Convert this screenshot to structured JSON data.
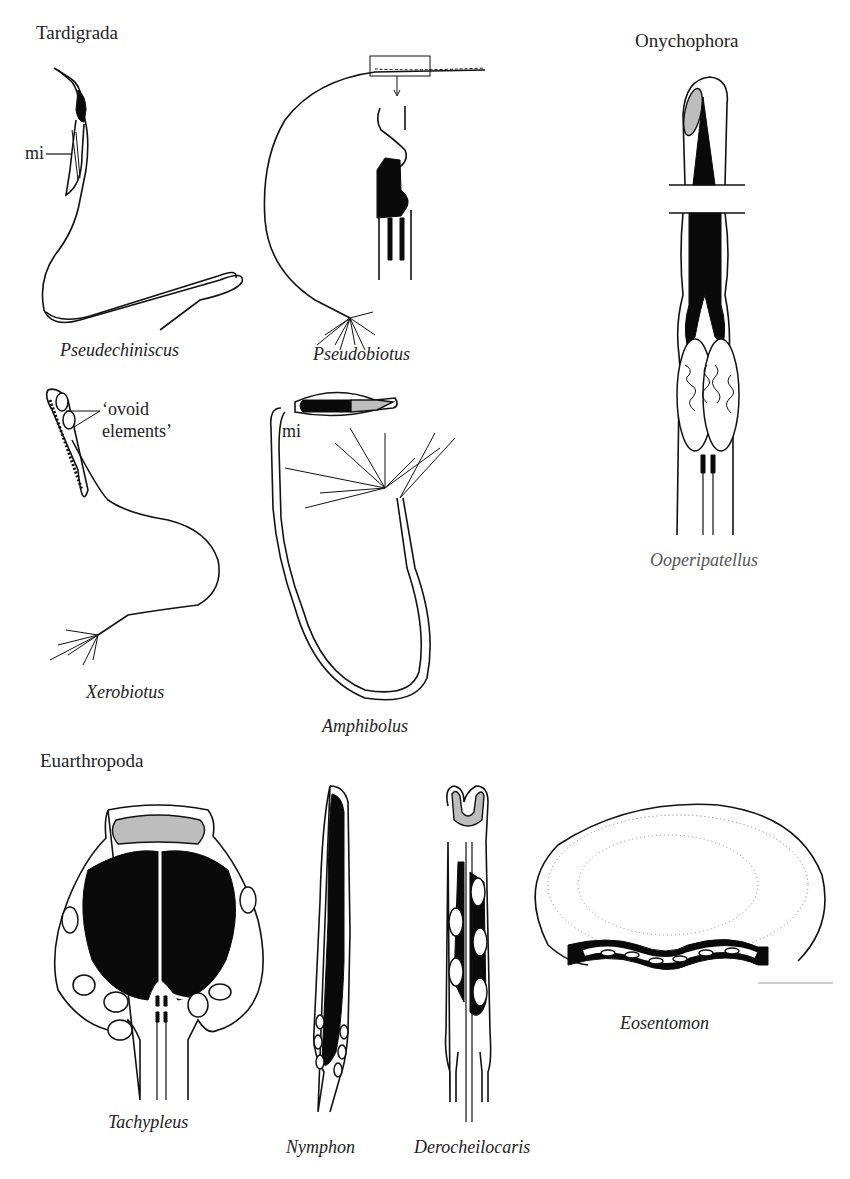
{
  "figure": {
    "groups": [
      {
        "id": "tardigrada",
        "label": "Tardigrada"
      },
      {
        "id": "onychophora",
        "label": "Onychophora"
      },
      {
        "id": "euarthropoda",
        "label": "Euarthropoda"
      }
    ],
    "taxa": {
      "pseudechiniscus": "Pseudechiniscus",
      "pseudobiotus": "Pseudobiotus",
      "xerobiotus": "Xerobiotus",
      "amphibolus": "Amphibolus",
      "ooperipatellus": "Ooperipatellus",
      "tachypleus": "Tachypleus",
      "nymphon": "Nymphon",
      "derocheilocaris": "Derocheilocaris",
      "eosentomon": "Eosentomon"
    },
    "annotations": {
      "mi_pseudechiniscus": "mi",
      "ovoid_line1": "‘ovoid",
      "ovoid_line2": "elements’",
      "mi_amphibolus": "mi"
    },
    "colors": {
      "ink": "#111111",
      "acrosome_gray": "#bdbdbd",
      "background": "#ffffff"
    }
  }
}
